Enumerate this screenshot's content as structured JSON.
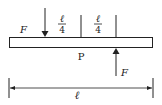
{
  "diagram": {
    "type": "beam-force-diagram",
    "beam": {
      "label": "P"
    },
    "forces": [
      {
        "label": "F",
        "direction": "down",
        "position": "left-quarter"
      },
      {
        "label": "F",
        "direction": "up",
        "position": "right-of-center"
      }
    ],
    "segments": [
      {
        "numerator": "ℓ",
        "denominator": "4"
      },
      {
        "numerator": "ℓ",
        "denominator": "4"
      }
    ],
    "dimension": {
      "label": "ℓ"
    },
    "colors": {
      "stroke": "#222222",
      "background": "#ffffff"
    }
  }
}
